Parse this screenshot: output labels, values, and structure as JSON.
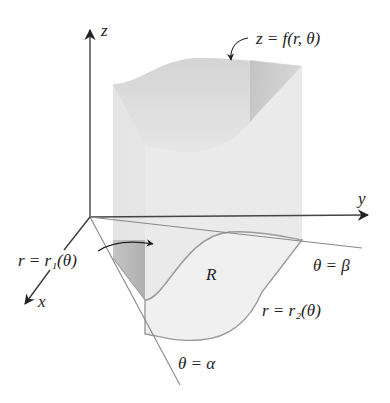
{
  "figure": {
    "axes": {
      "z": "z",
      "y": "y",
      "x": "x"
    },
    "labels": {
      "surface": "z = f(r, θ)",
      "inner_curve": "r = r₁(θ)",
      "outer_curve": "r = r₂(θ)",
      "region": "R",
      "ray_beta": "θ = β",
      "ray_alpha": "θ = α"
    },
    "colors": {
      "axis": "#333333",
      "solid_light": "#e8e8e8",
      "solid_mid": "#d2d2d2",
      "solid_dark": "#b8b8b8",
      "region_fill": "#eeeeee",
      "edge": "#999999"
    }
  }
}
